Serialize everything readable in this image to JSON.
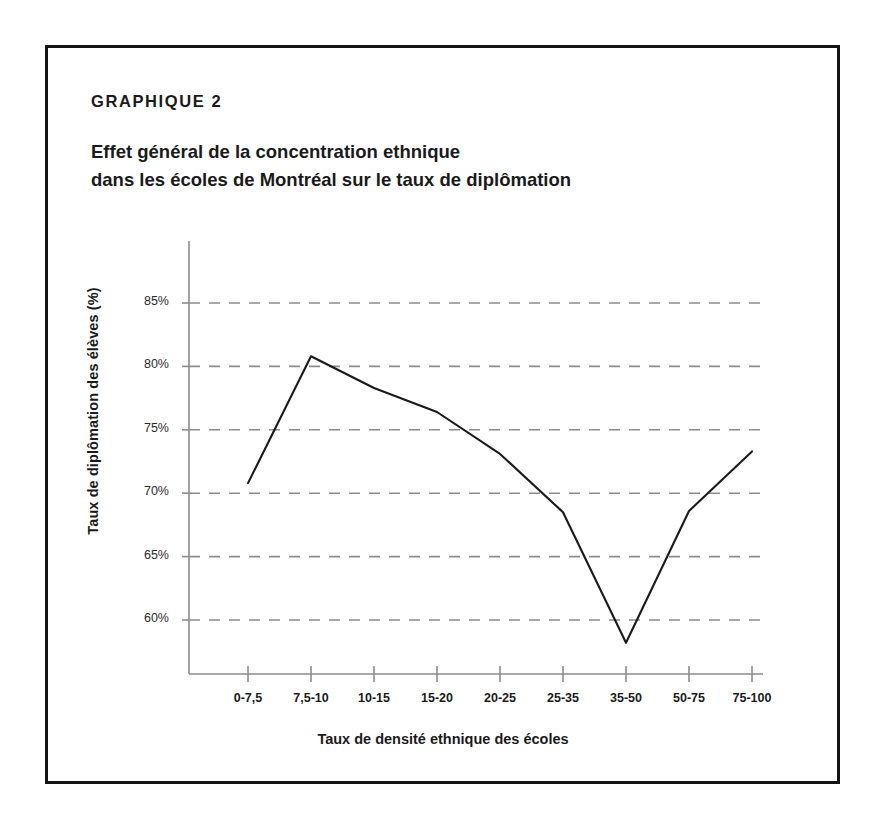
{
  "figure": {
    "eyebrow": "GRAPHIQUE 2",
    "title": "Effet général de la concentration ethnique\ndans les écoles de Montréal sur le taux de diplômation",
    "frame_color": "#141414",
    "line_color": "#1a1a1a",
    "grid_color": "#8c8c8c",
    "axis_color": "#8c8c8c"
  },
  "chart_data": {
    "type": "line",
    "title": "Effet général de la concentration ethnique dans les écoles de Montréal sur le taux de diplômation",
    "subtitle": "GRAPHIQUE 2",
    "xlabel": "Taux de densité ethnique des écoles",
    "ylabel": "Taux de diplômation des élèves (%)",
    "categories": [
      "0-7,5",
      "7,5-10",
      "10-15",
      "15-20",
      "20-25",
      "25-35",
      "35-50",
      "50-75",
      "75-100"
    ],
    "values": [
      70.8,
      80.8,
      78.3,
      76.4,
      73.1,
      68.5,
      58.2,
      68.6,
      73.3
    ],
    "ytick_labels": [
      "85%",
      "80%",
      "75%",
      "70%",
      "65%",
      "60%"
    ],
    "yticks": [
      85,
      80,
      75,
      70,
      65,
      60
    ],
    "ylim": [
      55.5,
      87.5
    ],
    "grid": "horizontal-dashed",
    "legend": "none",
    "series": [
      {
        "name": "Taux de diplômation des élèves (%)",
        "values": [
          70.8,
          80.8,
          78.3,
          76.4,
          73.1,
          68.5,
          58.2,
          68.6,
          73.3
        ]
      }
    ]
  }
}
